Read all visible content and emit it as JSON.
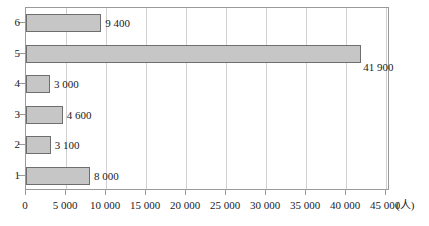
{
  "chart_data": {
    "type": "bar",
    "orientation": "horizontal",
    "title": "",
    "xlabel": "(人)",
    "ylabel": "",
    "categories": [
      "1",
      "2",
      "3",
      "4",
      "5",
      "6"
    ],
    "values": [
      8000,
      3100,
      4600,
      3000,
      41900,
      9400
    ],
    "value_labels": [
      "8 000",
      "3 100",
      "4 600",
      "3 000",
      "41 900",
      "9 400"
    ],
    "xlim": [
      0,
      45000
    ],
    "xticks": [
      0,
      5000,
      10000,
      15000,
      20000,
      25000,
      30000,
      35000,
      40000,
      45000
    ],
    "xtick_labels": [
      "0",
      "5 000",
      "10 000",
      "15 000",
      "20 000",
      "25 000",
      "30 000",
      "35 000",
      "40 000",
      "45 000"
    ],
    "ytick_labels_top_to_bottom": [
      "6",
      "5",
      "4",
      "3",
      "2",
      "1"
    ],
    "grid": "vertical",
    "legend": null,
    "unit": "(人)",
    "bar_fill_color": "#c6c6c6",
    "bar_border_color": "#6e6e6e",
    "gridline_color": "#d0d0d0",
    "axis_color": "#9a9a9a",
    "label_positions": {
      "8 000": "right",
      "3 100": "right",
      "4 600": "right",
      "3 000": "right",
      "41 900": "below-right-end",
      "9 400": "right"
    }
  }
}
